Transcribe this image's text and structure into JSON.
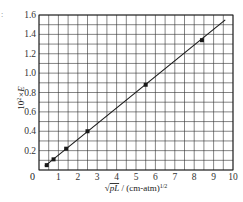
{
  "chart_data": {
    "type": "scatter",
    "title": "",
    "xlabel": "√(pL) / (cm-atm)^1/2",
    "xlabel_parts": {
      "radical": "√",
      "radicand": "pL",
      "unit": " / (cm-atm)",
      "exponent": "1/2"
    },
    "ylabel": "10²×E",
    "ylabel_parts": {
      "base": "10",
      "exp": "2",
      "rest": "×E"
    },
    "xlim": [
      0,
      10
    ],
    "ylim": [
      0,
      1.6
    ],
    "x_ticks": [
      "0",
      "1",
      "2",
      "3",
      "4",
      "5",
      "6",
      "7",
      "8",
      "9",
      "10"
    ],
    "y_ticks": [
      "0.2",
      "0.4",
      "0.6",
      "0.8",
      "1.0",
      "1.2",
      "1.4",
      "1.6"
    ],
    "origin_label": "0",
    "grid": true,
    "grid_x_step": 0.5,
    "grid_y_step": 0.1,
    "legend": null,
    "series": [
      {
        "name": "measured",
        "marker": "square",
        "x": [
          0.4,
          0.75,
          1.4,
          2.5,
          5.5,
          8.4
        ],
        "y": [
          0.05,
          0.11,
          0.22,
          0.4,
          0.88,
          1.34
        ]
      }
    ],
    "fit_line": {
      "x": [
        0.3,
        9.6
      ],
      "y": [
        0.04,
        1.55
      ]
    }
  },
  "colors": {
    "ink": "#1a1a1a",
    "grid": "#333333",
    "background": "#ffffff"
  }
}
